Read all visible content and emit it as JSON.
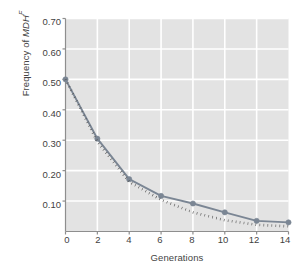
{
  "chart_data": {
    "type": "line",
    "title": "",
    "xlabel": "Generations",
    "ylabel_parts": {
      "prefix": "Frequency of ",
      "italic": "MDH",
      "superscript": "F"
    },
    "ylabel": "Frequency of MDHF",
    "x": [
      0,
      2,
      4,
      6,
      8,
      10,
      12,
      14
    ],
    "xlim": [
      0,
      14
    ],
    "ylim": [
      0,
      0.7
    ],
    "xticks": [
      "0",
      "2",
      "4",
      "6",
      "8",
      "10",
      "12",
      "14"
    ],
    "yticks": [
      "0.10",
      "0.20",
      "0.30",
      "0.40",
      "0.50",
      "0.60",
      "0.70"
    ],
    "ytick_values": [
      0.1,
      0.2,
      0.3,
      0.4,
      0.5,
      0.6,
      0.7
    ],
    "grid": true,
    "legend": "none",
    "series": [
      {
        "name": "observed",
        "style": "solid",
        "marker": "circle",
        "color": "#7b8694",
        "values": [
          0.5,
          0.305,
          0.172,
          0.117,
          0.092,
          0.063,
          0.035,
          0.03
        ]
      },
      {
        "name": "predicted",
        "style": "dotted",
        "marker": "none",
        "color": "#4f4f4f",
        "values": [
          0.5,
          0.295,
          0.163,
          0.104,
          0.063,
          0.037,
          0.022,
          0.017
        ]
      }
    ],
    "colors": {
      "plot_background": "#e3e3e3",
      "gridline": "#ffffff",
      "axis": "#8e8e8e",
      "text": "#3f3f3f",
      "series_observed": "#7b8694",
      "series_predicted": "#4f4f4f"
    }
  }
}
